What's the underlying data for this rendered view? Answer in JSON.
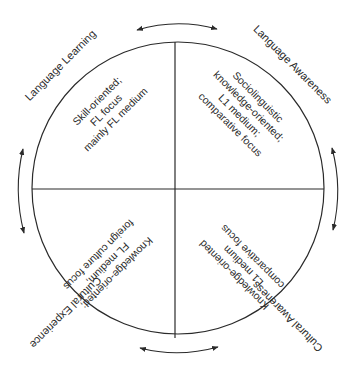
{
  "diagram": {
    "type": "circular-quadrant-model",
    "colors": {
      "line": "#2a2a2a",
      "text": "#2a2a2a",
      "background": "#ffffff"
    },
    "outer_labels": {
      "top_left": "Language Learning",
      "top_right": "Language Awareness",
      "bottom_right": "Cultural Awareness",
      "bottom_left": "Cultural Experience"
    },
    "quadrants": {
      "top_left": {
        "lines": [
          "Skill-oriented;",
          "FL focus",
          "mainly FL medium"
        ]
      },
      "top_right": {
        "lines": [
          "Sociolinguistic",
          "knowledge-oriented;",
          "L1 medium;",
          "comparative focus"
        ]
      },
      "bottom_right": {
        "lines": [
          "Knowledge-oriented",
          "L1 medium",
          "comparative focus"
        ]
      },
      "bottom_left": {
        "lines": [
          "Knowledge-oriented;",
          "FL medium;",
          "foreign culture focus"
        ]
      }
    },
    "arrows": [
      "top-double-arrow",
      "right-double-arrow",
      "bottom-double-arrow",
      "left-double-arrow"
    ]
  }
}
